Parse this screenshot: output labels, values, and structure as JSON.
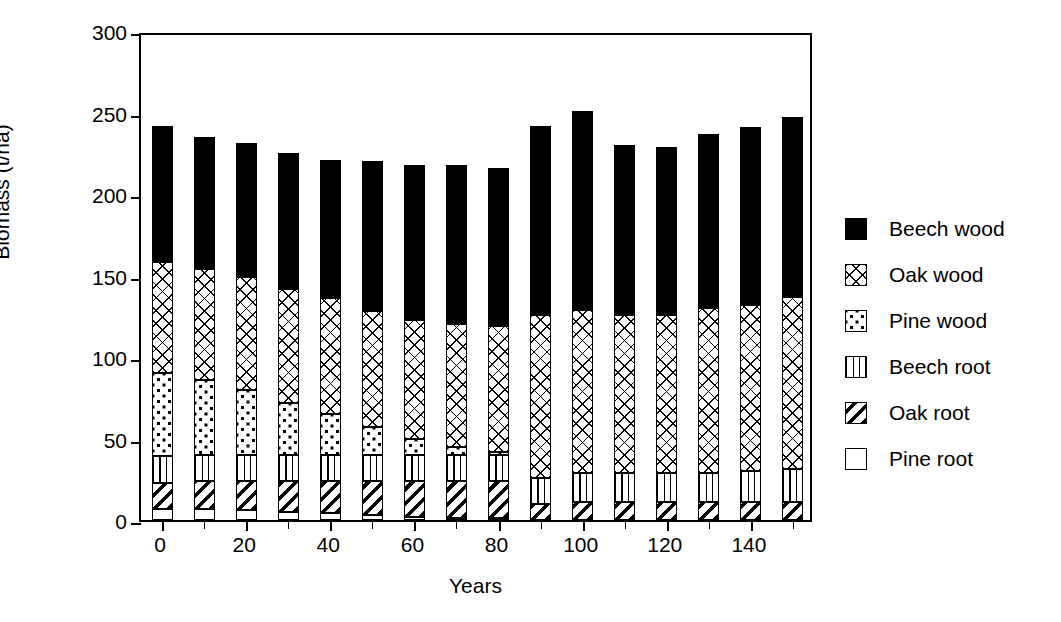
{
  "chart_data": {
    "type": "bar",
    "title": "",
    "stacked": true,
    "xlabel": "Years",
    "ylabel": "Biomass (t/ha)",
    "ylim": [
      0,
      300
    ],
    "yticks": [
      0,
      50,
      100,
      150,
      200,
      250,
      300
    ],
    "xlim": [
      -5,
      155
    ],
    "xticks": [
      0,
      20,
      40,
      60,
      80,
      100,
      120,
      140
    ],
    "xticks_minor": [
      10,
      30,
      50,
      70,
      90,
      110,
      130,
      150
    ],
    "grid": false,
    "legend_position": "right",
    "categories": [
      0,
      10,
      20,
      30,
      40,
      50,
      60,
      70,
      80,
      90,
      100,
      110,
      120,
      130,
      140,
      150
    ],
    "series": [
      {
        "name": "Pine root",
        "key": "pine-root",
        "fill": "white",
        "values": [
          7,
          7,
          6,
          5,
          4,
          3,
          2,
          1,
          1,
          0,
          0,
          0,
          0,
          0,
          0,
          0
        ]
      },
      {
        "name": "Oak root",
        "key": "oak-root",
        "fill": "diagonal-stripes",
        "values": [
          16,
          17,
          18,
          19,
          20,
          21,
          22,
          23,
          23,
          10,
          11,
          11,
          11,
          11,
          11,
          11
        ]
      },
      {
        "name": "Beech root",
        "key": "beech-root",
        "fill": "vertical-lines",
        "values": [
          16,
          16,
          16,
          16,
          16,
          16,
          16,
          16,
          16,
          16,
          18,
          18,
          18,
          18,
          19,
          20
        ]
      },
      {
        "name": "Pine wood",
        "key": "pine-wood",
        "fill": "dots",
        "values": [
          51,
          46,
          40,
          32,
          25,
          17,
          10,
          5,
          2,
          0,
          0,
          0,
          0,
          0,
          0,
          0
        ]
      },
      {
        "name": "Oak wood",
        "key": "oak-wood",
        "fill": "cross-hatch",
        "values": [
          68,
          68,
          69,
          70,
          71,
          71,
          73,
          75,
          77,
          100,
          100,
          97,
          97,
          101,
          102,
          106
        ]
      },
      {
        "name": "Beech wood",
        "key": "beech-wood",
        "fill": "solid-black",
        "values": [
          84,
          81,
          82,
          83,
          85,
          92,
          95,
          98,
          97,
          116,
          122,
          104,
          103,
          107,
          109,
          110
        ]
      }
    ],
    "totals": [
      242,
      235,
      231,
      225,
      221,
      220,
      218,
      218,
      216,
      242,
      251,
      230,
      229,
      237,
      241,
      247
    ]
  },
  "legend": {
    "items": [
      {
        "label": "Beech wood",
        "key": "beech-wood"
      },
      {
        "label": "Oak wood",
        "key": "oak-wood"
      },
      {
        "label": "Pine wood",
        "key": "pine-wood"
      },
      {
        "label": "Beech root",
        "key": "beech-root"
      },
      {
        "label": "Oak root",
        "key": "oak-root"
      },
      {
        "label": "Pine root",
        "key": "pine-root"
      }
    ]
  },
  "colors": {
    "ink": "#000000",
    "background": "#ffffff"
  }
}
